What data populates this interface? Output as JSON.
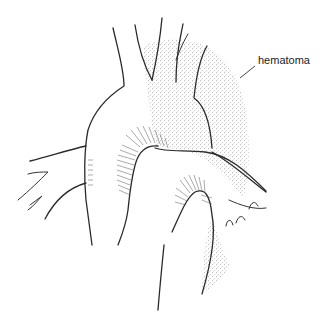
{
  "figure": {
    "labels": [
      {
        "id": "hematoma",
        "text": "hematoma",
        "x": 258,
        "y": 62
      }
    ],
    "colors": {
      "line": "#2a2a2a",
      "stipple": "#555555",
      "background": "#ffffff"
    }
  }
}
